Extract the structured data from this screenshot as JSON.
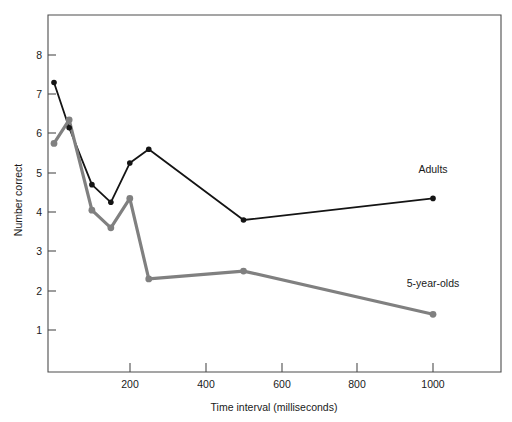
{
  "chart_data": {
    "type": "line",
    "title": "",
    "xlabel": "Time interval (milliseconds)",
    "ylabel": "Number correct",
    "xlim": [
      -20,
      1180
    ],
    "ylim": [
      0.2,
      8.6
    ],
    "grid": false,
    "legend_position": "inline-right",
    "x_ticks": [
      200,
      400,
      600,
      800,
      1000
    ],
    "x_tick_labels": [
      "200",
      "400",
      "600",
      "800",
      "1000"
    ],
    "y_ticks": [
      1,
      2,
      3,
      4,
      5,
      6,
      7,
      8
    ],
    "y_tick_labels": [
      "1",
      "2",
      "3",
      "4",
      "5",
      "6",
      "7",
      "8"
    ],
    "series": [
      {
        "name": "Adults",
        "color": "#141414",
        "marker": "circle",
        "x": [
          0,
          40,
          100,
          150,
          200,
          250,
          500,
          1000
        ],
        "values": [
          7.3,
          6.15,
          4.7,
          4.25,
          5.25,
          5.6,
          3.8,
          4.35
        ]
      },
      {
        "name": "5-year-olds",
        "color": "#808080",
        "marker": "circle",
        "x": [
          0,
          40,
          100,
          150,
          200,
          250,
          500,
          1000
        ],
        "values": [
          5.75,
          6.35,
          4.05,
          3.6,
          4.35,
          2.3,
          2.5,
          1.4
        ]
      }
    ],
    "annotations": [
      {
        "text": "Adults",
        "x": 1000,
        "y": 5.0
      },
      {
        "text": "5-year-olds",
        "x": 1000,
        "y": 2.1
      }
    ]
  }
}
